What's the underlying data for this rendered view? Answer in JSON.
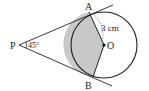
{
  "diagram": {
    "type": "geometry",
    "labels": {
      "P": "P",
      "A": "A",
      "B": "B",
      "O": "O",
      "angle": "45°",
      "radius": "3 cm"
    },
    "colors": {
      "stroke": "#222222",
      "shade": "#c8c8c8",
      "background": "#ffffff"
    }
  }
}
